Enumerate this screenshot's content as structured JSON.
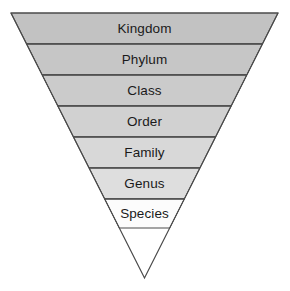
{
  "diagram": {
    "name": "taxonomic-rank-inverted-pyramid",
    "title": "",
    "shape": "inverted-pyramid",
    "background_color": "#ffffff",
    "outline_color": "#4a4a4a",
    "divider_color": "#3a3a3a",
    "text_color": "#1a1a1a",
    "geometry": {
      "top_left_x": 11,
      "top_right_x": 278,
      "top_y": 13,
      "apex_x": 144.5,
      "apex_y": 278
    },
    "levels": [
      {
        "label": "Kingdom",
        "rank": 1,
        "fill": "#c2c2c2",
        "top_y": 13,
        "bottom_y": 44,
        "label_y": 29
      },
      {
        "label": "Phylum",
        "rank": 2,
        "fill": "#c6c6c6",
        "top_y": 44,
        "bottom_y": 75,
        "label_y": 60
      },
      {
        "label": "Class",
        "rank": 3,
        "fill": "#cbcbcb",
        "top_y": 75,
        "bottom_y": 106,
        "label_y": 91
      },
      {
        "label": "Order",
        "rank": 4,
        "fill": "#d1d1d1",
        "top_y": 106,
        "bottom_y": 137,
        "label_y": 122
      },
      {
        "label": "Family",
        "rank": 5,
        "fill": "#d8d8d8",
        "top_y": 137,
        "bottom_y": 168,
        "label_y": 153
      },
      {
        "label": "Genus",
        "rank": 6,
        "fill": "#dedede",
        "top_y": 168,
        "bottom_y": 199,
        "label_y": 184
      },
      {
        "label": "Species",
        "rank": 7,
        "fill": "#fcfcfc",
        "top_y": 199,
        "bottom_y": 228,
        "label_y": 214
      }
    ]
  }
}
